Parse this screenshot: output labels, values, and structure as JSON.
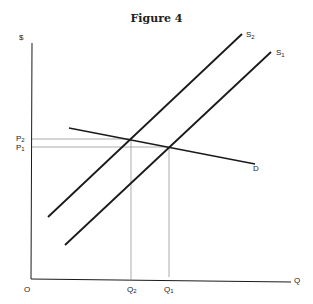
{
  "title": "Figure 4",
  "axes": {
    "y_label": "$",
    "x_label": "Q",
    "origin_label": "O"
  },
  "curves": {
    "s2": {
      "label": "S",
      "sub": "2"
    },
    "s1": {
      "label": "S",
      "sub": "1"
    },
    "d": {
      "label": "D"
    }
  },
  "price_labels": {
    "p2": {
      "label": "P",
      "sub": "2"
    },
    "p1": {
      "label": "P",
      "sub": "1"
    }
  },
  "quantity_labels": {
    "q2": {
      "label": "Q",
      "sub": "2"
    },
    "q1": {
      "label": "Q",
      "sub": "1"
    }
  },
  "colors": {
    "line": "#1a1a1a",
    "guide": "#888888"
  }
}
